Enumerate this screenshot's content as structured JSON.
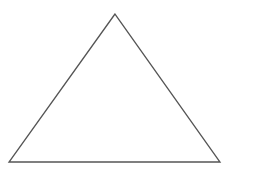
{
  "diagram": {
    "type": "triangle",
    "shape": "isosceles-like triangle outline",
    "vertices": {
      "apex": [
        115,
        14
      ],
      "bottom_left": [
        9,
        162
      ],
      "bottom_right": [
        220,
        162
      ]
    },
    "stroke_color": "#555555",
    "fill_color": "#ffffff",
    "stroke_width": 1.3
  }
}
